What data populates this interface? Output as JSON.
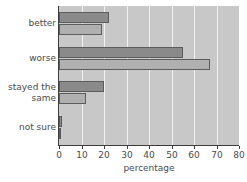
{
  "chart_data": {
    "type": "bar",
    "orientation": "horizontal",
    "title": "",
    "xlabel": "percentage",
    "ylabel": "",
    "xlim": [
      0,
      80
    ],
    "xticks": [
      0,
      10,
      20,
      30,
      40,
      50,
      60,
      70,
      80
    ],
    "grid": true,
    "legend": "none",
    "categories": [
      "better",
      "worse",
      "stayed the same",
      "not sure"
    ],
    "category_lines": [
      [
        "better"
      ],
      [
        "worse"
      ],
      [
        "stayed the",
        "same"
      ],
      [
        "not sure"
      ]
    ],
    "series": [
      {
        "name": "series-a",
        "color": "#8a8a8a",
        "values": [
          22,
          55,
          20,
          1.5
        ]
      },
      {
        "name": "series-b",
        "color": "#b0b0b0",
        "values": [
          19,
          67,
          12,
          1
        ]
      }
    ],
    "colors": {
      "plot_background": "#c8c8c8",
      "gridline": "#f2f2f2",
      "axis": "#3c3c3c",
      "bar_edge": "#5c5c5c",
      "text": "#4a4a4a",
      "page_background": "#ffffff"
    }
  }
}
